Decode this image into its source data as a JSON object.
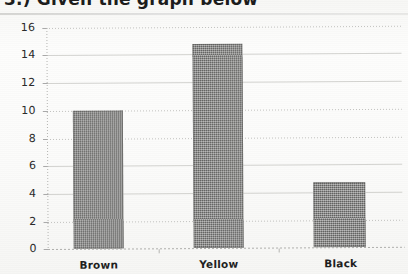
{
  "document": {
    "title_partial": "3.) Given the graph below",
    "background_note": "scanned-paper"
  },
  "chart_data": {
    "type": "bar",
    "title": "",
    "xlabel": "",
    "ylabel": "",
    "categories": [
      "Brown",
      "Yellow",
      "Black"
    ],
    "values": [
      10,
      14.8,
      4.7
    ],
    "ylim": [
      0,
      16
    ],
    "yticks": [
      0,
      2,
      4,
      6,
      8,
      10,
      12,
      14,
      16
    ],
    "ytick_labels": [
      "0",
      "2",
      "4",
      "6",
      "8",
      "10",
      "12",
      "14",
      "16"
    ],
    "grid": true,
    "legend": "none",
    "bar_color": "#7a7a78",
    "series": [
      {
        "name": "count",
        "values": [
          10,
          14.8,
          4.7
        ]
      }
    ]
  },
  "axis": {
    "y_labels": [
      "16",
      "14",
      "12",
      "10",
      "8",
      "6",
      "4",
      "2",
      "0"
    ],
    "x_labels": [
      "Brown",
      "Yellow",
      "Black"
    ]
  }
}
